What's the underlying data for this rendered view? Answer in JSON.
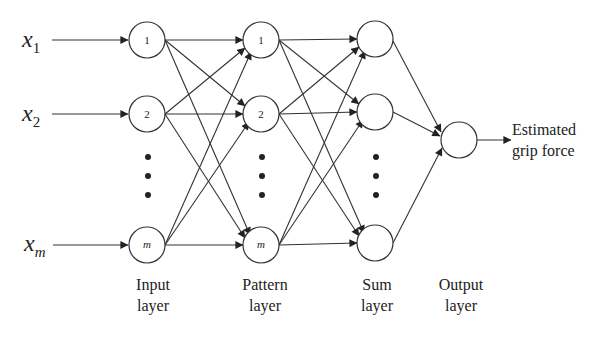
{
  "diagram": {
    "title": "",
    "inputs": [
      {
        "var": "x",
        "sub": "1",
        "sub_italic": false
      },
      {
        "var": "x",
        "sub": "2",
        "sub_italic": false
      },
      {
        "var": "x",
        "sub": "m",
        "sub_italic": true
      }
    ],
    "layers": [
      {
        "id": "input",
        "label_line1": "Input",
        "label_line2": "layer",
        "node_labels": [
          "1",
          "2",
          "m"
        ]
      },
      {
        "id": "pattern",
        "label_line1": "Pattern",
        "label_line2": "layer",
        "node_labels": [
          "1",
          "2",
          "m"
        ]
      },
      {
        "id": "sum",
        "label_line1": "Sum",
        "label_line2": "layer",
        "node_labels": [
          "",
          "",
          ""
        ]
      },
      {
        "id": "output",
        "label_line1": "Output",
        "label_line2": "layer",
        "node_labels": [
          ""
        ]
      }
    ],
    "output_label_line1": "Estimated",
    "output_label_line2": "grip force",
    "ellipsis": "⋮",
    "colors": {
      "stroke": "#333333",
      "background": "#ffffff",
      "text": "#222222"
    }
  }
}
